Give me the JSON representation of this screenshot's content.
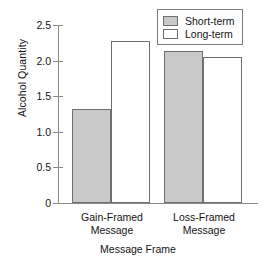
{
  "chart_data": {
    "type": "bar",
    "title": "",
    "xlabel": "Message Frame",
    "ylabel": "Alcohol Quantity",
    "categories": [
      "Gain-Framed Message",
      "Loss-Framed Message"
    ],
    "category_lines": [
      [
        "Gain-Framed",
        "Message"
      ],
      [
        "Loss-Framed",
        "Message"
      ]
    ],
    "series": [
      {
        "name": "Short-term",
        "values": [
          1.32,
          2.14
        ],
        "color": "#c9c9c9"
      },
      {
        "name": "Long-term",
        "values": [
          2.27,
          2.05
        ],
        "color": "#ffffff"
      }
    ],
    "ylim": [
      0,
      2.5
    ],
    "yticks": [
      0,
      0.5,
      1.0,
      1.5,
      2.0,
      2.5
    ],
    "ytick_labels": [
      "0",
      "0.5",
      "1.0",
      "1.5",
      "2.0",
      "2.5"
    ],
    "grid": false,
    "legend_position": "top-right",
    "legend_entries": [
      "Short-term",
      "Long-term"
    ]
  },
  "axis": {
    "y_title": "Alcohol Quantity",
    "x_title": "Message Frame",
    "ticks": {
      "t0": "0",
      "t1": "0.5",
      "t2": "1.0",
      "t3": "1.5",
      "t4": "2.0",
      "t5": "2.5"
    }
  },
  "legend": {
    "short_label": "Short-term",
    "long_label": "Long-term"
  },
  "categories": {
    "c0_line1": "Gain-Framed",
    "c0_line2": "Message",
    "c1_line1": "Loss-Framed",
    "c1_line2": "Message"
  }
}
